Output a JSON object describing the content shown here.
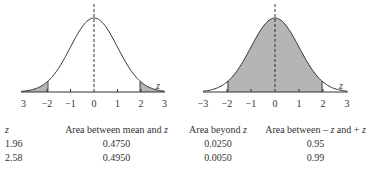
{
  "figure": {
    "left_chart": {
      "shading": "two tails beyond ±1.96",
      "tick_labels": [
        "3",
        "−2",
        "−1",
        "0",
        "1",
        "2",
        "3"
      ],
      "axis_label": "z"
    },
    "right_chart": {
      "shading": "between −1.96 and +1.96",
      "tick_labels": [
        "−3",
        "−2",
        "−1",
        "0",
        "1",
        "2",
        "3"
      ],
      "axis_label": "z"
    },
    "colors": {
      "curve": "#333333",
      "shade": "#b5b5b5"
    }
  },
  "table": {
    "headers": [
      "z",
      "Area between mean and z",
      "Area beyond z",
      "Area between − z and + z"
    ],
    "rows": [
      [
        "1.96",
        "0.4750",
        "0.0250",
        "0.95"
      ],
      [
        "2.58",
        "0.4950",
        "0.0050",
        "0.99"
      ]
    ]
  }
}
